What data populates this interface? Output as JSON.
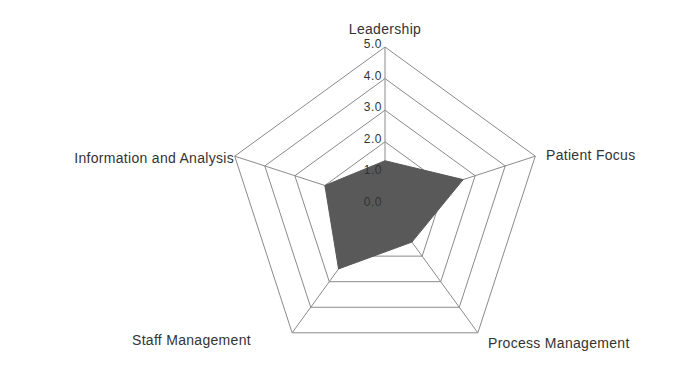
{
  "chart_data": {
    "type": "radar",
    "title": "",
    "axes": [
      "Leadership",
      "Patient Focus",
      "Process Management",
      "Staff Management",
      "Information and Analysis"
    ],
    "series": [
      {
        "name": "Score",
        "values": [
          1.4,
          2.6,
          1.45,
          2.5,
          2.0
        ],
        "color": "#595959"
      }
    ],
    "rlim": [
      0,
      5
    ],
    "ticks": [
      "0.0",
      "1.0",
      "2.0",
      "3.0",
      "4.0",
      "5.0"
    ],
    "grid": true,
    "legend": false
  },
  "style": {
    "grid_color": "#8a8a8a",
    "fill_color": "#595959",
    "text_color": "#333333"
  },
  "layout": {
    "cx": 385,
    "cy": 205,
    "radius": 158,
    "label_positions": [
      {
        "x": 385,
        "y": 34,
        "anchor": "middle"
      },
      {
        "x": 546,
        "y": 160,
        "anchor": "start"
      },
      {
        "x": 488,
        "y": 348,
        "anchor": "start"
      },
      {
        "x": 132,
        "y": 345,
        "anchor": "start"
      },
      {
        "x": 234,
        "y": 163,
        "anchor": "end"
      }
    ]
  }
}
